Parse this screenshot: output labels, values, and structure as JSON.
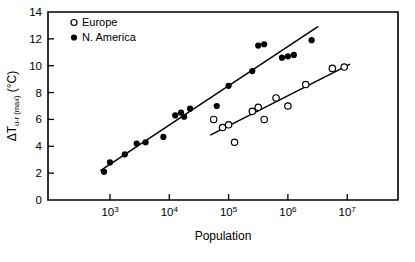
{
  "chart_data": {
    "type": "scatter",
    "title": "",
    "xlabel": "Population",
    "ylabel": "ΔT u-r (max) (°C)",
    "ylabel_main": "ΔT",
    "ylabel_subscript": "u-r (max)",
    "ylabel_units": "(°C)",
    "xscale": "log",
    "yscale": "linear",
    "xlim": [
      630,
      31000000
    ],
    "ylim": [
      0,
      14
    ],
    "grid": false,
    "legend_position": "top-left",
    "xticks": [
      1000,
      10000,
      100000,
      1000000,
      10000000
    ],
    "xtick_labels": [
      "103",
      "104",
      "105",
      "106",
      "107"
    ],
    "xtick_mantissas": [
      "10",
      "10",
      "10",
      "10",
      "10"
    ],
    "xtick_exponents": [
      "3",
      "4",
      "5",
      "6",
      "7"
    ],
    "yticks": [
      0,
      2,
      4,
      6,
      8,
      10,
      12,
      14
    ],
    "ytick_labels": [
      "0",
      "2",
      "4",
      "6",
      "8",
      "10",
      "12",
      "14"
    ],
    "series": [
      {
        "name": "Europe",
        "marker": "open-circle",
        "color": "#000000",
        "points": [
          [
            56000,
            6.0
          ],
          [
            79000,
            5.4
          ],
          [
            100000,
            5.6
          ],
          [
            126000,
            4.3
          ],
          [
            251000,
            6.6
          ],
          [
            316000,
            6.9
          ],
          [
            398000,
            6.0
          ],
          [
            631000,
            7.6
          ],
          [
            1000000,
            7.0
          ],
          [
            2000000,
            8.6
          ],
          [
            5620000,
            9.8
          ],
          [
            8910000,
            9.9
          ]
        ],
        "fit_line": {
          "x_start": 50000,
          "y_start": 4.85,
          "x_end": 11000000,
          "y_end": 10.1
        }
      },
      {
        "name": "N. America",
        "marker": "filled-circle",
        "color": "#000000",
        "points": [
          [
            794,
            2.1
          ],
          [
            1000,
            2.8
          ],
          [
            1780,
            3.4
          ],
          [
            2820,
            4.2
          ],
          [
            3980,
            4.3
          ],
          [
            7940,
            4.7
          ],
          [
            12600,
            6.3
          ],
          [
            15800,
            6.5
          ],
          [
            17800,
            6.2
          ],
          [
            22400,
            6.8
          ],
          [
            63100,
            7.0
          ],
          [
            100000,
            8.5
          ],
          [
            251000,
            9.6
          ],
          [
            316000,
            11.5
          ],
          [
            398000,
            11.6
          ],
          [
            794000,
            10.6
          ],
          [
            1000000,
            10.7
          ],
          [
            1260000,
            10.8
          ],
          [
            2510000,
            11.9
          ]
        ],
        "fit_line": {
          "x_start": 700,
          "y_start": 2.2,
          "x_end": 3160000,
          "y_end": 12.9
        }
      }
    ]
  },
  "legend": {
    "items": [
      {
        "label": "Europe",
        "marker": "open-circle"
      },
      {
        "label": "N. America",
        "marker": "filled-circle"
      }
    ]
  }
}
